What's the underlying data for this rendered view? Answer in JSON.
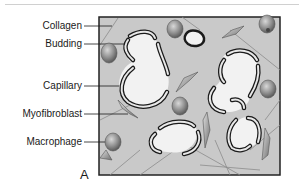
{
  "figure": {
    "panel_letter": "A",
    "labels": {
      "collagen": "Collagen",
      "budding": "Budding",
      "capillary": "Capillary",
      "myofibroblast": "Myofibroblast",
      "macrophage": "Macrophage"
    },
    "colors": {
      "background": "#c9c9c9",
      "border": "#222222",
      "capillary_lumen": "#f2f2f2",
      "cell_fill": "#8a8a8a"
    }
  }
}
